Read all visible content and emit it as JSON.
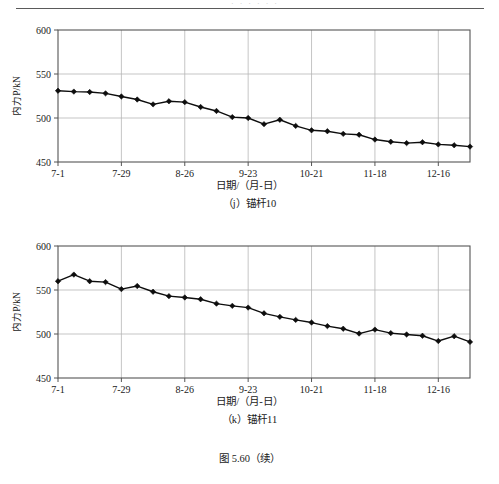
{
  "document": {
    "figure_caption": "图 5.60（续）",
    "header_ghost": "· · · · · ·"
  },
  "chart_data": [
    {
      "id": "j",
      "type": "line",
      "title": "（j）锚杆10",
      "xlabel": "日期/（月-日）",
      "ylabel": "内力P/kN",
      "ylim": [
        450,
        600
      ],
      "yticks": [
        450,
        500,
        550,
        600
      ],
      "xticks": [
        "7-1",
        "7-29",
        "8-26",
        "9-23",
        "10-21",
        "11-18",
        "12-16"
      ],
      "xtick_indices": [
        0,
        4,
        8,
        12,
        16,
        20,
        24
      ],
      "grid": true,
      "legend": "none",
      "marker": "diamond",
      "x": [
        "7-1",
        "7-8",
        "7-15",
        "7-22",
        "7-29",
        "8-5",
        "8-12",
        "8-19",
        "8-26",
        "9-2",
        "9-9",
        "9-16",
        "9-23",
        "9-30",
        "10-7",
        "10-14",
        "10-21",
        "10-28",
        "11-4",
        "11-11",
        "11-18",
        "11-25",
        "12-2",
        "12-9",
        "12-16",
        "12-23",
        "12-30"
      ],
      "values": [
        531,
        530,
        529.5,
        528,
        524.5,
        521,
        515.5,
        519,
        518,
        512.5,
        508,
        501,
        500,
        493,
        498,
        491,
        486,
        485,
        482,
        481,
        475.5,
        473,
        471.5,
        472.5,
        470,
        469,
        467.5
      ]
    },
    {
      "id": "k",
      "type": "line",
      "title": "（k）锚杆11",
      "xlabel": "日期/（月-日）",
      "ylabel": "内力P/kN",
      "ylim": [
        450,
        600
      ],
      "yticks": [
        450,
        500,
        550,
        600
      ],
      "xticks": [
        "7-1",
        "7-29",
        "8-26",
        "9-23",
        "10-21",
        "11-18",
        "12-16"
      ],
      "xtick_indices": [
        0,
        4,
        8,
        12,
        16,
        20,
        24
      ],
      "grid": true,
      "legend": "none",
      "marker": "diamond",
      "x": [
        "7-1",
        "7-8",
        "7-15",
        "7-22",
        "7-29",
        "8-5",
        "8-12",
        "8-19",
        "8-26",
        "9-2",
        "9-9",
        "9-16",
        "9-23",
        "9-30",
        "10-7",
        "10-14",
        "10-21",
        "10-28",
        "11-4",
        "11-11",
        "11-18",
        "11-25",
        "12-2",
        "12-9",
        "12-16",
        "12-23",
        "12-30"
      ],
      "values": [
        560,
        567.5,
        560,
        559,
        551,
        554.5,
        548,
        543,
        541.5,
        539.5,
        534.5,
        532,
        530,
        523.5,
        519.5,
        516,
        513,
        509,
        506,
        500.5,
        505,
        501,
        499.5,
        498,
        492,
        497.5,
        491
      ]
    }
  ]
}
